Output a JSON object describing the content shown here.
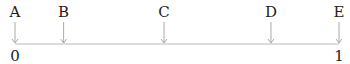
{
  "diagram": {
    "type": "number-line",
    "range": [
      0,
      1
    ],
    "end_labels": [
      "0",
      "1"
    ],
    "points": [
      {
        "label": "A",
        "value": 0.0
      },
      {
        "label": "B",
        "value": 0.15
      },
      {
        "label": "C",
        "value": 0.46
      },
      {
        "label": "D",
        "value": 0.79
      },
      {
        "label": "E",
        "value": 1.0
      }
    ],
    "colors": {
      "line": "#bbbbbb",
      "arrow": "#aaaaaa",
      "text": "#222222"
    }
  }
}
